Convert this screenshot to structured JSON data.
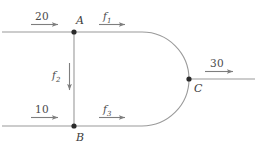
{
  "diagram": {
    "type": "flow-network",
    "colors": {
      "stroke": "#9a9a9a",
      "node": "#2b2b2b",
      "arrow": "#7e7e7e",
      "text": "#4a4a4a",
      "background": "#ffffff"
    },
    "nodes": [
      {
        "id": "A",
        "label": "A",
        "x": 74,
        "y": 32
      },
      {
        "id": "B",
        "label": "B",
        "x": 74,
        "y": 126
      },
      {
        "id": "C",
        "label": "C",
        "x": 189,
        "y": 79
      }
    ],
    "edges": [
      {
        "id": "f1",
        "label": "f",
        "subscript": "1",
        "from": "A",
        "to": "C",
        "direction": "right"
      },
      {
        "id": "f2",
        "label": "f",
        "subscript": "2",
        "from": "A",
        "to": "B",
        "direction": "down"
      },
      {
        "id": "f3",
        "label": "f",
        "subscript": "3",
        "from": "B",
        "to": "C",
        "direction": "right"
      }
    ],
    "external_flows": [
      {
        "id": "in-top",
        "value": "20",
        "target": "A",
        "direction": "right"
      },
      {
        "id": "in-bottom",
        "value": "10",
        "target": "B",
        "direction": "right"
      },
      {
        "id": "out-right",
        "value": "30",
        "source": "C",
        "direction": "right"
      }
    ]
  }
}
